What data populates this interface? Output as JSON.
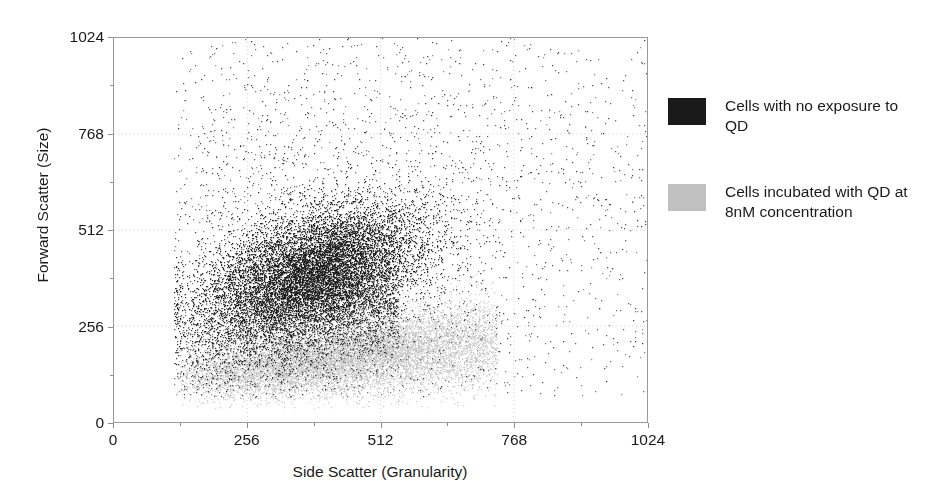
{
  "chart_data": {
    "type": "scatter",
    "title": "",
    "xlabel": "Side Scatter (Granularity)",
    "ylabel": "Forward Scatter (Size)",
    "xlim": [
      0,
      1024
    ],
    "ylim": [
      0,
      1024
    ],
    "xticks": [
      0,
      256,
      512,
      768,
      1024
    ],
    "yticks": [
      0,
      256,
      512,
      768,
      1024
    ],
    "xtick_labels": [
      "0",
      "256",
      "512",
      "768",
      "1024"
    ],
    "ytick_labels": [
      "0",
      "256",
      "512",
      "768",
      "1024"
    ],
    "grid": true,
    "grid_style": "dotted",
    "minor_ticks": true,
    "legend_position": "right",
    "background": "#ffffff",
    "frame_color": "#9a9a9a",
    "series": [
      {
        "name": "Cells with no exposure to QD",
        "color": "#1a1a1a",
        "n_points": 17000,
        "description": "Dense dark population; main cluster centered near SSC 380, FSC 400, elongated along a positive diagonal, plus a broad sparse halo of single events spread across the upper and right portions of the plot up to 1024,1024.",
        "cluster_center": [
          380,
          400
        ],
        "cluster_spread": [
          130,
          120
        ],
        "left_cutoff": 115
      },
      {
        "name": "Cells incubated with QD at 8nM concentration",
        "color": "#c0c0c0",
        "n_points": 14000,
        "description": "Light grey population lying below the dark cluster; a band running from lower-left to the right with a rising lower boundary, centered near SSC 400, FSC 205, tapering in density toward higher side scatter.",
        "cluster_center": [
          400,
          205
        ],
        "cluster_spread": [
          150,
          75
        ],
        "left_cutoff": 115
      }
    ]
  },
  "axes": {
    "y_title": "Forward Scatter (Size)",
    "x_title": "Side Scatter (Granularity)"
  },
  "legend": {
    "entries": [
      {
        "label": "Cells with no exposure to QD",
        "swatch_color": "#1a1a1a",
        "swatch_name": "dark-swatch"
      },
      {
        "label": "Cells incubated with QD at 8nM concentration",
        "swatch_color": "#c0c0c0",
        "swatch_name": "light-swatch"
      }
    ]
  }
}
